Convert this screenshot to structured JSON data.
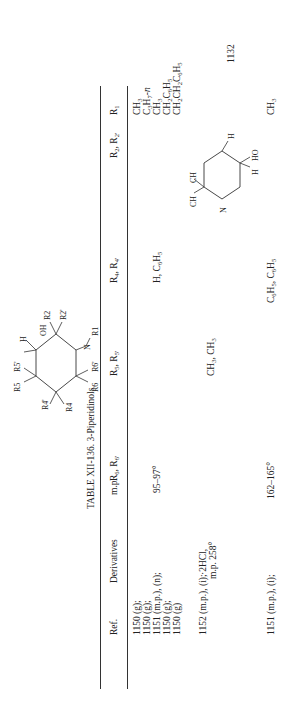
{
  "page": {
    "orientation": "rotated-90-ccw",
    "page_number": "1132"
  },
  "structure": {
    "labels": [
      "R4'",
      "R4",
      "OH",
      "H",
      "R2",
      "R2'",
      "N",
      "R1",
      "R5",
      "R5'",
      "R6",
      "R6'"
    ]
  },
  "table": {
    "title": "TABLE XII-136.  3-Piperidinols",
    "headers": {
      "r1": "R",
      "r1_sub": "1",
      "r2": "R",
      "r2_sub": "2",
      "r2b": ", R",
      "r2b_sub": "2'",
      "r4": "R",
      "r4_sub": "4",
      "r4b": ", R",
      "r4b_sub": "4'",
      "r5": "R",
      "r5_sub": "5",
      "r5b": ", R",
      "r5b_sub": "5'",
      "r6": "R",
      "r6_sub": "6",
      "r6b": ", R",
      "r6b_sub": "6'",
      "mp": "m.p.",
      "derivatives": "Derivatives",
      "ref": "Ref."
    },
    "rows": [
      {
        "r1": "CH3",
        "r4": "",
        "r5": "",
        "mp": "",
        "derivatives": "",
        "ref": "1150 (g);"
      },
      {
        "r1": "C3H7-n",
        "r4": "",
        "r5": "",
        "mp": "",
        "derivatives": "",
        "ref": "1150 (g);"
      },
      {
        "r1": "CH3",
        "r4": "H, C6H5",
        "r5": "",
        "mp": "95–97°",
        "derivatives": "",
        "ref": "1151 (m.p.), (n);"
      },
      {
        "r1": "CH2C6H5",
        "r4": "",
        "r5": "",
        "mp": "",
        "derivatives": "",
        "ref": "1150 (g);"
      },
      {
        "r1": "CH2CH2C6H5",
        "r4": "",
        "r5": "",
        "mp": "",
        "derivatives": "",
        "ref": "1150 (g)"
      },
      {
        "r1": "",
        "r2_structure": "5,5-dimethyl-3-piperidinol ring (CH3; CH3, H; HO; H; N; H)",
        "r4": "",
        "r5": "CH3, CH3",
        "mp": "",
        "derivatives": "·2HCl, m.p. 258°",
        "ref": "1152 (m.p.), (i);"
      },
      {
        "r1": "CH3",
        "r4": "C6H5, C6H5",
        "r5": "",
        "mp": "162–165°",
        "derivatives": "",
        "ref": "1151 (m.p.), (i);"
      }
    ],
    "display": {
      "row1_r1": "CH",
      "row1_r1_s": "3",
      "row2_r1": "C",
      "row2_r1_s": "3",
      "row2_r1_b": "H",
      "row2_r1_bs": "7",
      "row2_r1_c": "-n",
      "row3_r1": "CH",
      "row3_r1_s": "3",
      "row4_r1": "CH",
      "row4_r1_s": "2",
      "row4_r1_b": "C",
      "row4_r1_bs": "6",
      "row4_r1_c": "H",
      "row4_r1_cs": "5",
      "row5_r1": "CH",
      "row5_r1_s": "2",
      "row5_r1_b": "CH",
      "row5_r1_bs": "2",
      "row5_r1_c": "C",
      "row5_r1_cs": "6",
      "row5_r1_d": "H",
      "row5_r1_ds": "5",
      "row3_r4": "H, C",
      "row3_r4_s": "6",
      "row3_r4_b": "H",
      "row3_r4_bs": "5",
      "row3_mp": "95–97°",
      "row6_r5": "CH",
      "row6_r5_s": "3",
      "row6_r5_b": ", CH",
      "row6_r5_bs": "3",
      "row6_deriv1": "·2HCl,",
      "row6_deriv2": "m.p. 258°",
      "row7_r1": "CH",
      "row7_r1_s": "3",
      "row7_r4": "C",
      "row7_r4_s": "6",
      "row7_r4_b": "H",
      "row7_r4_bs": "5",
      "row7_r4_c": ", C",
      "row7_r4_cs": "6",
      "row7_r4_d": "H",
      "row7_r4_ds": "5",
      "row7_mp": "162–165°",
      "ref1": "1150 (g);",
      "ref2": "1150 (g);",
      "ref3": "1151 (m.p.), (n);",
      "ref4": "1150 (g);",
      "ref5": "1150 (g)",
      "ref6": "1152 (m.p.), (i);",
      "ref7": "1151 (m.p.), (i);"
    },
    "row6_structure_labels": {
      "ch3_top": "CH",
      "ch3_top_s": "3",
      "ch3_h": "CH",
      "ch3_h_s": "3",
      "ch3_h_tail": ", H",
      "h_left": "H",
      "ho": "HO",
      "h_bottom": "H",
      "n": "N"
    }
  }
}
